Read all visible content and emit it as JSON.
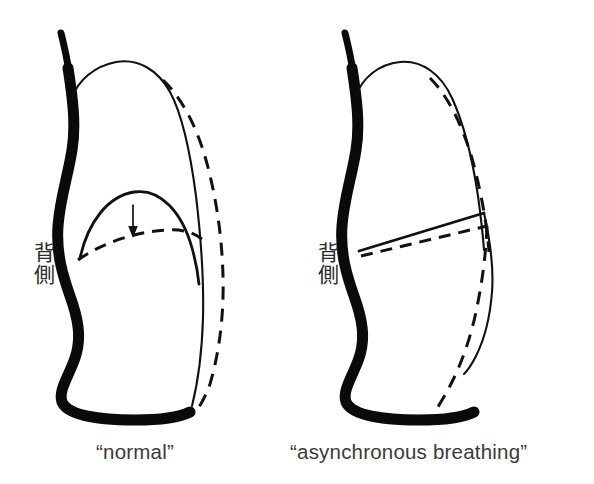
{
  "figure": {
    "type": "medical-illustration",
    "background_color": "#ffffff",
    "ink_color": "#111111",
    "caption_color": "#3a3a3a",
    "panels": [
      {
        "id": "left",
        "caption": "“normal”",
        "dorsal_label": {
          "chars": [
            "背",
            "側"
          ],
          "romaji_meaning": "dorsal side"
        },
        "diaphragm_shape": "dome",
        "arrow": {
          "direction": "down",
          "meaning": "diaphragm descends"
        },
        "lines": {
          "solid": "end-expiration outline",
          "dashed": "end-inspiration outline"
        }
      },
      {
        "id": "right",
        "caption": "“asynchronous breathing”",
        "dorsal_label": {
          "chars": [
            "背",
            "側"
          ],
          "romaji_meaning": "dorsal side"
        },
        "diaphragm_shape": "oblique-flattened",
        "arrow": null,
        "lines": {
          "solid": "end-expiration outline",
          "dashed": "end-inspiration outline"
        }
      }
    ]
  }
}
